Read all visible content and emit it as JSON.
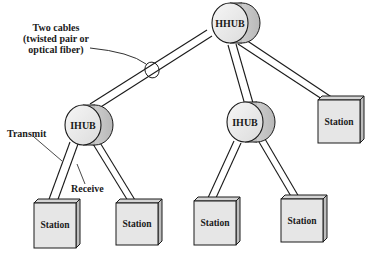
{
  "diagram": {
    "type": "hierarchical-star-topology",
    "nodes": {
      "hhub": {
        "label": "HHUB",
        "kind": "header-hub"
      },
      "ihub_left": {
        "label": "IHUB",
        "kind": "intermediate-hub"
      },
      "ihub_right": {
        "label": "IHUB",
        "kind": "intermediate-hub"
      },
      "station_top_right": {
        "label": "Station"
      },
      "station_1": {
        "label": "Station"
      },
      "station_2": {
        "label": "Station"
      },
      "station_3": {
        "label": "Station"
      },
      "station_4": {
        "label": "Station"
      }
    },
    "edges": [
      {
        "from": "HHUB",
        "to": "IHUB (left)"
      },
      {
        "from": "HHUB",
        "to": "IHUB (right)"
      },
      {
        "from": "HHUB",
        "to": "Station (top right)"
      },
      {
        "from": "IHUB (left)",
        "to": "Station 1"
      },
      {
        "from": "IHUB (left)",
        "to": "Station 2"
      },
      {
        "from": "IHUB (right)",
        "to": "Station 3"
      },
      {
        "from": "IHUB (right)",
        "to": "Station 4"
      }
    ],
    "annotations": {
      "cables_line1": "Two cables",
      "cables_line2": "(twisted pair or",
      "cables_line3": "optical fiber)",
      "transmit": "Transmit",
      "receive": "Receive"
    },
    "colors": {
      "line": "#1a1a1a",
      "hub_face": "#ececec",
      "hub_side": "#c9c9c9",
      "station_face": "#e6e6e6",
      "station_side": "#bdbdbd",
      "station_top": "#d4d4d4"
    }
  }
}
